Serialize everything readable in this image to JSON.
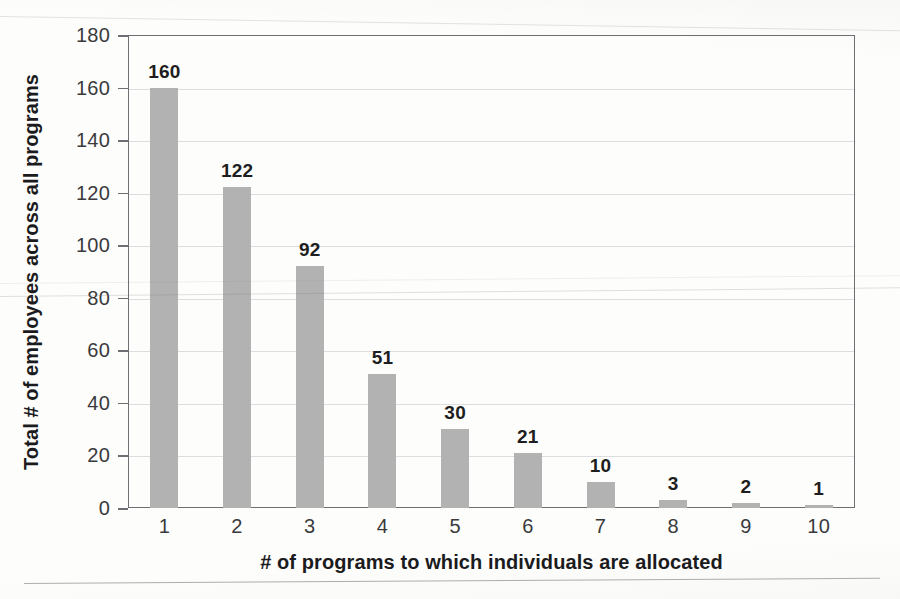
{
  "chart_data": {
    "type": "bar",
    "title": "",
    "categories": [
      "1",
      "2",
      "3",
      "4",
      "5",
      "6",
      "7",
      "8",
      "9",
      "10"
    ],
    "values": [
      160,
      122,
      92,
      51,
      30,
      21,
      10,
      3,
      2,
      1
    ],
    "data_labels": [
      "160",
      "122",
      "92",
      "51",
      "30",
      "21",
      "10",
      "3",
      "2",
      "1"
    ],
    "xlabel": "# of programs to which individuals are allocated",
    "ylabel": "Total # of employees across all programs",
    "ylim": [
      0,
      180
    ],
    "ytick_values": [
      0,
      20,
      40,
      60,
      80,
      100,
      120,
      140,
      160,
      180
    ],
    "ytick_labels": [
      "0",
      "20",
      "40",
      "60",
      "80",
      "100",
      "120",
      "140",
      "160",
      "180"
    ],
    "grid": true,
    "legend": "none",
    "bar_color": "#b2b2b2",
    "axis_color": "#6f6f73",
    "text_color": "#1e1e20"
  }
}
